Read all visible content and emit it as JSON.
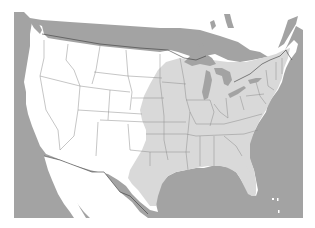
{
  "map": {
    "subject": "Contiguous United States with shaded region over the central and eastern states",
    "colors": {
      "background": "#ffffff",
      "ocean": "#a3a3a3",
      "land": "#ffffff",
      "shaded_region": "#d9d9d9",
      "lakes": "#a3a3a3",
      "state_borders": "#8c8c8c",
      "international_border": "#3a3a3a"
    },
    "frame": {
      "x": 14,
      "y": 12,
      "width": 289,
      "height": 206
    },
    "legend": null,
    "labels": []
  }
}
